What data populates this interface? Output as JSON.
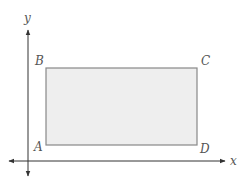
{
  "diagram": {
    "type": "rectangle-on-coordinate-plane",
    "axes": {
      "x_label": "x",
      "y_label": "y"
    },
    "vertices": [
      {
        "name": "A",
        "position": "bottom-left"
      },
      {
        "name": "B",
        "position": "top-left"
      },
      {
        "name": "C",
        "position": "top-right"
      },
      {
        "name": "D",
        "position": "bottom-right"
      }
    ],
    "colors": {
      "rect_fill": "#eeeeee",
      "rect_stroke": "#888888",
      "axis": "#333333",
      "label": "#555555"
    }
  }
}
